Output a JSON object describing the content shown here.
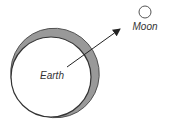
{
  "diagram": {
    "earth": {
      "label": "Earth",
      "fill": "#ffffff",
      "stroke": "#333333"
    },
    "tidal_bulge": {
      "fill": "#999999"
    },
    "moon": {
      "label": "Moon",
      "fill": "#ffffff",
      "stroke": "#555555"
    },
    "arrow": {
      "from": "Earth center",
      "to": "Moon",
      "color": "#222222"
    }
  }
}
